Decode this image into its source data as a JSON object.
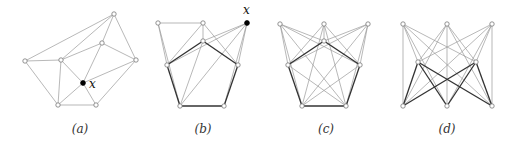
{
  "figure": {
    "panels": [
      {
        "id": "a",
        "caption": "(a)",
        "caption_x": 80,
        "special_label": "x",
        "label_pos": [
          90,
          78
        ],
        "nodes": [
          {
            "id": "top",
            "x": 114,
            "y": 14,
            "filled": false
          },
          {
            "id": "mid",
            "x": 102,
            "y": 43,
            "filled": false
          },
          {
            "id": "left",
            "x": 25,
            "y": 61,
            "filled": false
          },
          {
            "id": "inner",
            "x": 61,
            "y": 60,
            "filled": false
          },
          {
            "id": "right",
            "x": 136,
            "y": 60,
            "filled": false
          },
          {
            "id": "x",
            "x": 83,
            "y": 83,
            "filled": true
          },
          {
            "id": "bl",
            "x": 58,
            "y": 105,
            "filled": false
          },
          {
            "id": "br",
            "x": 96,
            "y": 105,
            "filled": false
          }
        ],
        "edges": [
          [
            "left",
            "top",
            1
          ],
          [
            "inner",
            "top",
            1
          ],
          [
            "mid",
            "top",
            1
          ],
          [
            "top",
            "right",
            1
          ],
          [
            "left",
            "inner",
            1
          ],
          [
            "inner",
            "mid",
            1
          ],
          [
            "mid",
            "right",
            1
          ],
          [
            "left",
            "bl",
            1
          ],
          [
            "inner",
            "bl",
            1
          ],
          [
            "inner",
            "x",
            1
          ],
          [
            "mid",
            "x",
            1
          ],
          [
            "x",
            "right",
            1
          ],
          [
            "x",
            "bl",
            1
          ],
          [
            "x",
            "br",
            1
          ],
          [
            "br",
            "right",
            1
          ],
          [
            "bl",
            "br",
            1
          ]
        ]
      },
      {
        "id": "b",
        "caption": "(b)",
        "caption_x": 203,
        "special_label": "x",
        "label_pos": [
          243,
          6
        ],
        "nodes": [
          {
            "id": "tl",
            "x": 158,
            "y": 23,
            "filled": false
          },
          {
            "id": "tm",
            "x": 203,
            "y": 23,
            "filled": false
          },
          {
            "id": "x",
            "x": 247,
            "y": 23,
            "filled": true
          },
          {
            "id": "it",
            "x": 203,
            "y": 41,
            "filled": false
          },
          {
            "id": "l",
            "x": 167,
            "y": 65,
            "filled": false
          },
          {
            "id": "r",
            "x": 238,
            "y": 65,
            "filled": false
          },
          {
            "id": "bl",
            "x": 180,
            "y": 106,
            "filled": false
          },
          {
            "id": "br",
            "x": 224,
            "y": 106,
            "filled": false
          }
        ],
        "edges": [
          [
            "tl",
            "tm",
            1
          ],
          [
            "tl",
            "l",
            1
          ],
          [
            "tl",
            "bl",
            1
          ],
          [
            "tm",
            "it",
            1
          ],
          [
            "tm",
            "l",
            1
          ],
          [
            "tm",
            "r",
            1
          ],
          [
            "x",
            "it",
            1
          ],
          [
            "x",
            "l",
            1
          ],
          [
            "x",
            "r",
            1
          ],
          [
            "x",
            "bl",
            1
          ],
          [
            "x",
            "br",
            1
          ],
          [
            "it",
            "l",
            2
          ],
          [
            "it",
            "r",
            2
          ],
          [
            "l",
            "bl",
            2
          ],
          [
            "r",
            "br",
            2
          ],
          [
            "bl",
            "br",
            2
          ],
          [
            "it",
            "bl",
            1
          ]
        ]
      },
      {
        "id": "c",
        "caption": "(c)",
        "caption_x": 326,
        "special_label": "",
        "label_pos": [
          0,
          0
        ],
        "nodes": [
          {
            "id": "tl",
            "x": 280,
            "y": 24,
            "filled": false
          },
          {
            "id": "tm",
            "x": 324,
            "y": 24,
            "filled": false
          },
          {
            "id": "tr",
            "x": 368,
            "y": 24,
            "filled": false
          },
          {
            "id": "it",
            "x": 324,
            "y": 41,
            "filled": false
          },
          {
            "id": "l",
            "x": 288,
            "y": 65,
            "filled": false
          },
          {
            "id": "r",
            "x": 360,
            "y": 65,
            "filled": false
          },
          {
            "id": "bl",
            "x": 302,
            "y": 106,
            "filled": false
          },
          {
            "id": "br",
            "x": 346,
            "y": 106,
            "filled": false
          }
        ],
        "edges": [
          [
            "tl",
            "it",
            1
          ],
          [
            "tl",
            "l",
            1
          ],
          [
            "tl",
            "r",
            1
          ],
          [
            "tl",
            "bl",
            1
          ],
          [
            "tl",
            "br",
            1
          ],
          [
            "tm",
            "it",
            1
          ],
          [
            "tm",
            "l",
            1
          ],
          [
            "tm",
            "r",
            1
          ],
          [
            "tm",
            "bl",
            1
          ],
          [
            "tm",
            "br",
            1
          ],
          [
            "tr",
            "it",
            1
          ],
          [
            "tr",
            "l",
            1
          ],
          [
            "tr",
            "r",
            1
          ],
          [
            "tr",
            "bl",
            1
          ],
          [
            "tr",
            "br",
            1
          ],
          [
            "it",
            "l",
            2
          ],
          [
            "it",
            "r",
            2
          ],
          [
            "l",
            "bl",
            2
          ],
          [
            "r",
            "br",
            2
          ],
          [
            "bl",
            "br",
            2
          ],
          [
            "l",
            "br",
            1
          ],
          [
            "r",
            "bl",
            1
          ]
        ]
      },
      {
        "id": "d",
        "caption": "(d)",
        "caption_x": 447,
        "special_label": "",
        "label_pos": [
          0,
          0
        ],
        "nodes": [
          {
            "id": "tl",
            "x": 403,
            "y": 24,
            "filled": false
          },
          {
            "id": "tm",
            "x": 447,
            "y": 24,
            "filled": false
          },
          {
            "id": "tr",
            "x": 492,
            "y": 24,
            "filled": false
          },
          {
            "id": "ml",
            "x": 418,
            "y": 62,
            "filled": false
          },
          {
            "id": "mr",
            "x": 476,
            "y": 62,
            "filled": false
          },
          {
            "id": "bl",
            "x": 403,
            "y": 106,
            "filled": false
          },
          {
            "id": "bm",
            "x": 447,
            "y": 106,
            "filled": false
          },
          {
            "id": "br",
            "x": 492,
            "y": 106,
            "filled": false
          }
        ],
        "edges": [
          [
            "tl",
            "bl",
            1
          ],
          [
            "tr",
            "br",
            1
          ],
          [
            "tm",
            "bm",
            1
          ],
          [
            "tl",
            "ml",
            1
          ],
          [
            "tl",
            "mr",
            1
          ],
          [
            "tl",
            "bm",
            1
          ],
          [
            "tl",
            "br",
            1
          ],
          [
            "tm",
            "ml",
            1
          ],
          [
            "tm",
            "mr",
            1
          ],
          [
            "tm",
            "bl",
            1
          ],
          [
            "tm",
            "br",
            1
          ],
          [
            "tr",
            "ml",
            1
          ],
          [
            "tr",
            "mr",
            1
          ],
          [
            "tr",
            "bl",
            1
          ],
          [
            "tr",
            "bm",
            1
          ],
          [
            "ml",
            "bl",
            2
          ],
          [
            "ml",
            "bm",
            2
          ],
          [
            "ml",
            "br",
            2
          ],
          [
            "mr",
            "bl",
            2
          ],
          [
            "mr",
            "bm",
            2
          ],
          [
            "mr",
            "br",
            2
          ]
        ]
      }
    ]
  }
}
